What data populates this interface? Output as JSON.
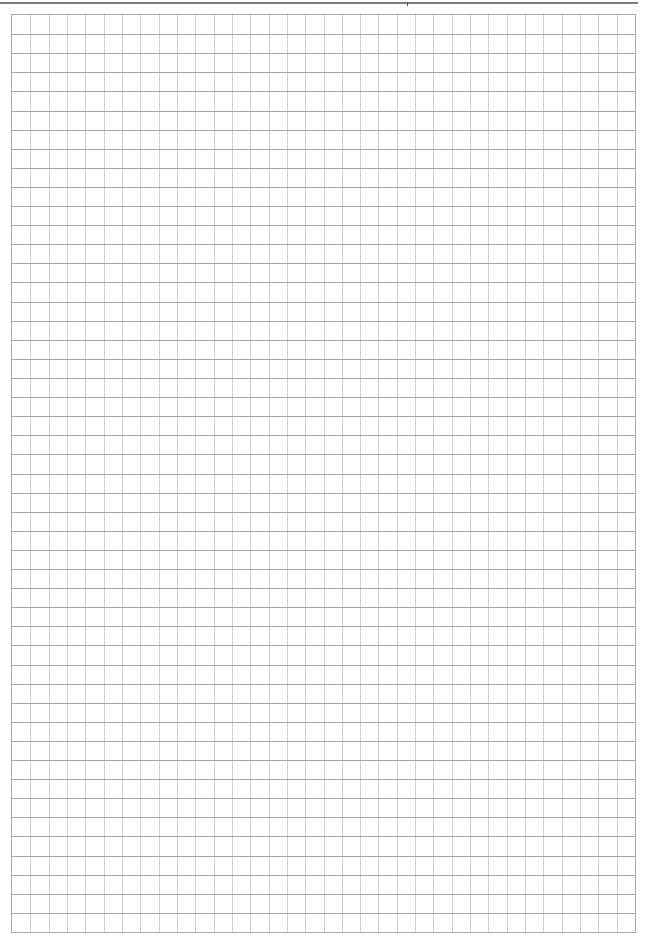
{
  "page": {
    "type": "graph-paper",
    "width": 648,
    "height": 943,
    "background": "#ffffff"
  },
  "header_rule": {
    "color": "#7c7c7c",
    "tick_x": 407
  },
  "grid": {
    "left": 11,
    "top": 14,
    "width": 625,
    "height": 919,
    "columns": 34,
    "rows": 48,
    "border_color": "#a8a8a8",
    "vertical_line_color": "#cfcfcf",
    "horizontal_line_color": "#a6a6a6"
  }
}
